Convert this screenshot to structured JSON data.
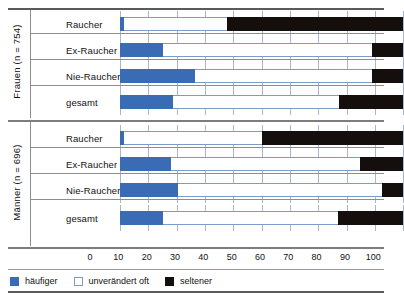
{
  "chart_data": {
    "type": "bar",
    "orientation": "horizontal",
    "stacked": true,
    "title": "",
    "xlabel": "",
    "ylabel": "",
    "xlim": [
      0,
      100
    ],
    "xticks": [
      0,
      10,
      20,
      30,
      40,
      50,
      60,
      70,
      80,
      90,
      100
    ],
    "grid": true,
    "legend_position": "bottom-left",
    "legend": [
      "häufiger",
      "unverändert oft",
      "seltener"
    ],
    "colors": {
      "haeufiger": "#3a6cb5",
      "unveraendert_oft": "#ffffff",
      "seltener": "#140f0d"
    },
    "groups": [
      {
        "name": "Frauen (n = 754)",
        "categories": [
          "Raucher",
          "Ex-Raucher",
          "Nie-Raucher",
          "gesamt"
        ],
        "series": [
          {
            "name": "häufiger",
            "values": [
              1.5,
              15.3,
              26.5,
              18.8
            ]
          },
          {
            "name": "unverändert oft",
            "values": [
              36.2,
              73.5,
              62.3,
              58.5
            ]
          },
          {
            "name": "seltener",
            "values": [
              62.3,
              11.2,
              11.2,
              22.7
            ]
          }
        ]
      },
      {
        "name": "Männer (n = 696)",
        "categories": [
          "Raucher",
          "Ex-Raucher",
          "Nie-Raucher",
          "gesamt"
        ],
        "series": [
          {
            "name": "häufiger",
            "values": [
              1.5,
              18.0,
              20.6,
              15.3
            ]
          },
          {
            "name": "unverändert oft",
            "values": [
              48.5,
              66.7,
              71.8,
              61.7
            ]
          },
          {
            "name": "seltener",
            "values": [
              50.0,
              15.3,
              7.6,
              23.0
            ]
          }
        ]
      }
    ]
  },
  "axis": {
    "tick_labels": [
      "0",
      "10",
      "20",
      "30",
      "40",
      "50",
      "60",
      "70",
      "80",
      "90",
      "100"
    ]
  },
  "groups": [
    {
      "side_label": "Frauen (n = 754)",
      "rows": [
        {
          "label": "Raucher",
          "haeufiger": 1.5,
          "unveraendert": 36.2,
          "seltener": 62.3
        },
        {
          "label": "Ex-Raucher",
          "haeufiger": 15.3,
          "unveraendert": 73.5,
          "seltener": 11.2
        },
        {
          "label": "Nie-Raucher",
          "haeufiger": 26.5,
          "unveraendert": 62.3,
          "seltener": 11.2
        },
        {
          "label": "gesamt",
          "haeufiger": 18.8,
          "unveraendert": 58.5,
          "seltener": 22.7
        }
      ]
    },
    {
      "side_label": "Männer (n = 696)",
      "rows": [
        {
          "label": "Raucher",
          "haeufiger": 1.5,
          "unveraendert": 48.5,
          "seltener": 50.0
        },
        {
          "label": "Ex-Raucher",
          "haeufiger": 18.0,
          "unveraendert": 66.7,
          "seltener": 15.3
        },
        {
          "label": "Nie-Raucher",
          "haeufiger": 20.6,
          "unveraendert": 71.8,
          "seltener": 7.6
        },
        {
          "label": "gesamt",
          "haeufiger": 15.3,
          "unveraendert": 61.7,
          "seltener": 23.0
        }
      ]
    }
  ],
  "legend": {
    "items": [
      {
        "label": "häufiger",
        "swatch": "blue-swatch-icon"
      },
      {
        "label": "unverändert oft",
        "swatch": "white-swatch-icon"
      },
      {
        "label": "seltener",
        "swatch": "black-swatch-icon"
      }
    ]
  }
}
